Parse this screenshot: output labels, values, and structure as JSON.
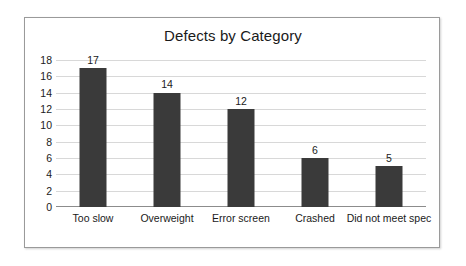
{
  "chart_data": {
    "type": "bar",
    "title": "Defects by Category",
    "xlabel": "",
    "ylabel": "",
    "categories": [
      "Too slow",
      "Overweight",
      "Error screen",
      "Crashed",
      "Did not meet spec"
    ],
    "values": [
      17,
      14,
      12,
      6,
      5
    ],
    "data_labels": [
      "17",
      "14",
      "12",
      "6",
      "5"
    ],
    "ylim": [
      0,
      18
    ],
    "ytick_step": 2,
    "ytick_labels": [
      "18",
      "16",
      "14",
      "12",
      "10",
      "8",
      "6",
      "4",
      "2",
      "0"
    ],
    "ytick_values": [
      18,
      16,
      14,
      12,
      10,
      8,
      6,
      4,
      2,
      0
    ],
    "grid": "horizontal",
    "legend": "none",
    "bar_color": "#3a3a3a",
    "gridline_color": "#d8d8d8",
    "axis_color": "#8c8c8c",
    "background_color": "#ffffff",
    "border_color": "#9a9a9a"
  }
}
